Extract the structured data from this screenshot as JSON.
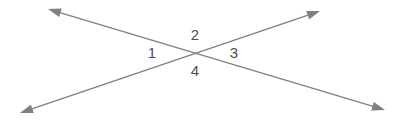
{
  "figure": {
    "background_color": "#ffffff",
    "line_color": "#808080",
    "label_color": "#4d4d4d",
    "line_width": 1.4,
    "width": 401,
    "height": 123
  },
  "intersection": {
    "label": "intersection point",
    "x": 199,
    "y": 53
  },
  "lines": [
    {
      "name": "line-falling",
      "description": "double-headed arrow from upper-left to lower-right",
      "from": {
        "x": 48,
        "y": 9
      },
      "to": {
        "x": 385,
        "y": 110
      },
      "arrow_start": true,
      "arrow_end": true
    },
    {
      "name": "line-rising",
      "description": "double-headed arrow from lower-left to upper-right",
      "from": {
        "x": 20,
        "y": 113
      },
      "to": {
        "x": 320,
        "y": 11
      },
      "arrow_start": true,
      "arrow_end": true
    }
  ],
  "labels": [
    {
      "id": "angle-1",
      "text": "1",
      "x": 152,
      "y": 54,
      "position": "left"
    },
    {
      "id": "angle-2",
      "text": "2",
      "x": 195,
      "y": 36,
      "position": "top"
    },
    {
      "id": "angle-3",
      "text": "3",
      "x": 234,
      "y": 54,
      "position": "right"
    },
    {
      "id": "angle-4",
      "text": "4",
      "x": 195,
      "y": 72,
      "position": "bottom"
    }
  ],
  "arrowhead": {
    "length": 13,
    "half_width": 4.5
  }
}
